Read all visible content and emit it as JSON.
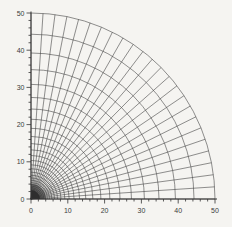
{
  "figure": {
    "background": "#f5f4f1",
    "mesh_line_color": "#474747",
    "axis_color": "#333333",
    "text_color": "#3b3b3b",
    "origin_blob_color": "#2d2d2d"
  },
  "chart_data": {
    "type": "line",
    "subtype": "polar-quarter-mesh-grid",
    "title": "",
    "xlabel": "",
    "ylabel": "",
    "xlim": [
      0,
      50
    ],
    "ylim": [
      0,
      50
    ],
    "x_ticks": [
      0,
      10,
      20,
      30,
      40,
      50
    ],
    "y_ticks": [
      0,
      10,
      20,
      30,
      40,
      50
    ],
    "minor_tick_step": 2,
    "grid": "mesh",
    "legend": "none",
    "mesh": {
      "theta_start_deg": 0,
      "theta_end_deg": 90,
      "n_spokes": 25,
      "r_outer": 50,
      "r_ratio": 0.886,
      "radii": [
        50,
        44.3,
        39.25,
        34.78,
        30.81,
        27.3,
        24.19,
        21.43,
        18.99,
        16.82,
        14.9,
        13.21,
        11.7,
        10.37,
        9.19,
        8.14,
        7.21,
        6.39,
        5.66,
        5.02,
        4.44,
        3.94,
        3.49,
        3.09,
        2.74,
        2.43,
        2.15,
        1.9,
        1.69,
        1.5,
        1.33,
        1.17,
        1.04,
        0.92,
        0.82,
        0.72,
        0.64,
        0.57,
        0.5
      ]
    }
  }
}
